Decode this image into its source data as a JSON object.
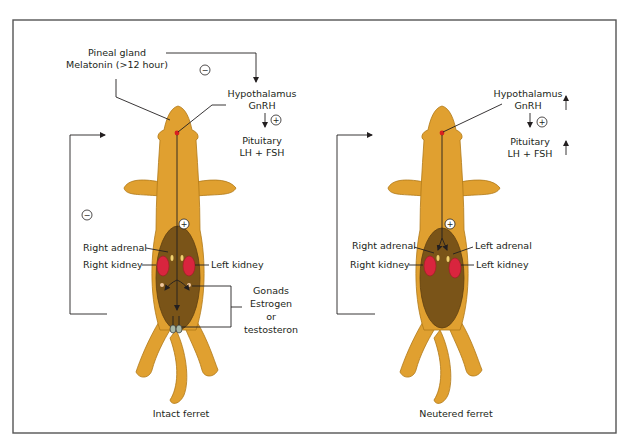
{
  "figure": {
    "colors": {
      "fur": "#e0a030",
      "belly": "#7a5418",
      "kidney": "#d9253e",
      "pineal_dot": "#d82020",
      "frame": "#555555",
      "text": "#231f20"
    },
    "symbols": {
      "inhibit": "−",
      "stimulate": "+"
    },
    "intact": {
      "caption": "Intact ferret",
      "pineal_label_line1": "Pineal gland",
      "pineal_label_line2": "Melatonin (>12 hour)",
      "hypothalamus_line1": "Hypothalamus",
      "hypothalamus_line2": "GnRH",
      "pituitary_line1": "Pituitary",
      "pituitary_line2": "LH + FSH",
      "right_adrenal": "Right adrenal",
      "right_kidney": "Right kidney",
      "left_kidney": "Left kidney",
      "gonads_line1": "Gonads",
      "gonads_line2": "Estrogen",
      "gonads_line3": "or",
      "gonads_line4": "testosteron"
    },
    "neutered": {
      "caption": "Neutered ferret",
      "hypothalamus_line1": "Hypothalamus",
      "hypothalamus_line2": "GnRH",
      "pituitary_line1": "Pituitary",
      "pituitary_line2": "LH + FSH",
      "right_adrenal": "Right adrenal",
      "left_adrenal": "Left adrenal",
      "right_kidney": "Right kidney",
      "left_kidney": "Left kidney",
      "hypothalamus_trend": "increased",
      "pituitary_trend": "increased"
    }
  }
}
